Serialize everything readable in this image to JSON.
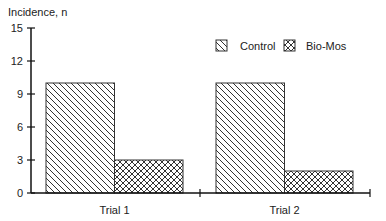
{
  "chart_data": {
    "type": "bar",
    "title": "",
    "ylabel": "Incidence, n",
    "xlabel": "",
    "categories": [
      "Trial 1",
      "Trial 2"
    ],
    "series": [
      {
        "name": "Control",
        "values": [
          10,
          10
        ],
        "pattern": "diagonal-hatch"
      },
      {
        "name": "Bio-Mos",
        "values": [
          3,
          2
        ],
        "pattern": "crosshatch"
      }
    ],
    "ylim": [
      0,
      15
    ],
    "yticks": [
      0,
      3,
      6,
      9,
      12,
      15
    ],
    "grid": false,
    "legend_position": "upper-right"
  },
  "labels": {
    "ylabel": "Incidence, n",
    "yticks": [
      "0",
      "3",
      "6",
      "9",
      "12",
      "15"
    ],
    "categories": [
      "Trial 1",
      "Trial 2"
    ],
    "legend": [
      "Control",
      "Bio-Mos"
    ]
  }
}
